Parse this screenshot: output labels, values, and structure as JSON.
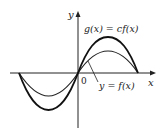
{
  "diagram": {
    "axes": {
      "x_label": "x",
      "y_label": "y",
      "origin_label": "0"
    },
    "curves": [
      {
        "name": "f",
        "label": "y = f(x)",
        "amplitude_px": 22,
        "stroke": "#222222",
        "width": 1.2
      },
      {
        "name": "g",
        "label": "g(x) = cf(x)",
        "amplitude_px": 36,
        "stroke": "#111111",
        "width": 1.8
      }
    ],
    "period_px": 119,
    "origin_px": [
      78,
      73
    ]
  }
}
